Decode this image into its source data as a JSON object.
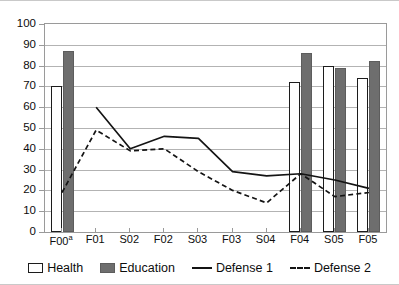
{
  "chart_data": {
    "type": "bar",
    "title": "",
    "subtitle": "",
    "xlabel": "",
    "ylabel": "",
    "ylim": [
      0,
      100
    ],
    "ytick_step": 10,
    "ytick_labels": [
      "0",
      "10",
      "20",
      "30",
      "40",
      "50",
      "60",
      "70",
      "80",
      "90",
      "100"
    ],
    "grid": true,
    "legend_position": "bottom",
    "categories": [
      "F00a",
      "F01",
      "S02",
      "F02",
      "S03",
      "F03",
      "S04",
      "F04",
      "S05",
      "F05"
    ],
    "category_labels": [
      {
        "text": "F00",
        "sup": "a"
      },
      {
        "text": "F01",
        "sup": ""
      },
      {
        "text": "S02",
        "sup": ""
      },
      {
        "text": "F02",
        "sup": ""
      },
      {
        "text": "S03",
        "sup": ""
      },
      {
        "text": "F03",
        "sup": ""
      },
      {
        "text": "S04",
        "sup": ""
      },
      {
        "text": "F04",
        "sup": ""
      },
      {
        "text": "S05",
        "sup": ""
      },
      {
        "text": "F05",
        "sup": ""
      }
    ],
    "series": [
      {
        "name": "Health",
        "kind": "bar",
        "color": "#ffffff",
        "edge_color": "#1c1c1c",
        "values": [
          70,
          null,
          null,
          null,
          null,
          null,
          null,
          72,
          80,
          74
        ]
      },
      {
        "name": "Education",
        "kind": "bar",
        "color": "#6e6e6e",
        "edge_color": "#5d5d5d",
        "values": [
          87,
          null,
          null,
          null,
          null,
          null,
          null,
          86,
          79,
          82
        ]
      },
      {
        "name": "Defense 1",
        "kind": "line",
        "style": "solid",
        "color": "#141414",
        "values": [
          null,
          60,
          40,
          46,
          45,
          29,
          27,
          28,
          25,
          21
        ]
      },
      {
        "name": "Defense 2",
        "kind": "line",
        "style": "dashed",
        "color": "#141414",
        "values": [
          19,
          49,
          39,
          40,
          29,
          20,
          14,
          28,
          17,
          19
        ]
      }
    ]
  },
  "legend": {
    "items": [
      {
        "label": "Health",
        "marker": "box-white"
      },
      {
        "label": "Education",
        "marker": "box-gray"
      },
      {
        "label": "Defense 1",
        "marker": "line-solid"
      },
      {
        "label": "Defense 2",
        "marker": "line-dashed"
      }
    ]
  }
}
